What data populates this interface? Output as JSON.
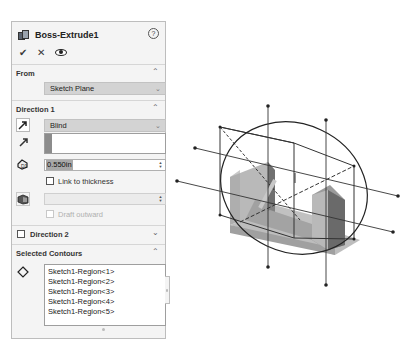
{
  "panel": {
    "title": "Boss-Extrude1",
    "help_icon": "?",
    "actions": {
      "ok": "✔",
      "cancel": "✕",
      "preview": "eye-icon"
    }
  },
  "from": {
    "title": "From",
    "selected": "Sketch Plane"
  },
  "direction1": {
    "title": "Direction 1",
    "end_condition": "Blind",
    "depth": "0.550in",
    "link_to_thickness": "Link to thickness",
    "draft_outward": "Draft outward"
  },
  "direction2": {
    "title": "Direction 2"
  },
  "selected_contours": {
    "title": "Selected Contours",
    "items": [
      "Sketch1-Region<1>",
      "Sketch1-Region<2>",
      "Sketch1-Region<3>",
      "Sketch1-Region<4>",
      "Sketch1-Region<5>"
    ]
  },
  "colors": {
    "panel_bg": "#f4f4f4",
    "select_bg": "#d3d3d3",
    "model_gray": "#9a9a9a"
  }
}
